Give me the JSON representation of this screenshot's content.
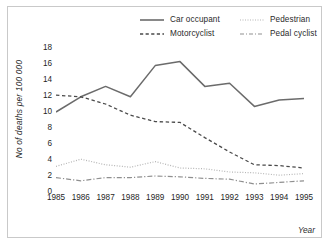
{
  "chart_data": {
    "type": "line",
    "title": "",
    "subtitle": "",
    "xlabel": "Year",
    "ylabel": "No of deaths per 100 000",
    "categories": [
      "1985",
      "1986",
      "1987",
      "1988",
      "1989",
      "1990",
      "1991",
      "1992",
      "1993",
      "1994",
      "1995"
    ],
    "x": [
      1985,
      1986,
      1987,
      1988,
      1989,
      1990,
      1991,
      1992,
      1993,
      1994,
      1995
    ],
    "xlim": [
      1985,
      1995
    ],
    "ylim": [
      0,
      18
    ],
    "yticks": [
      0,
      2,
      4,
      6,
      8,
      10,
      12,
      14,
      16,
      18
    ],
    "grid": false,
    "legend_position": "top-center",
    "series": [
      {
        "name": "Car occupant",
        "style": "solid",
        "color": "#6b6b6b",
        "values": [
          10.0,
          11.9,
          13.2,
          11.9,
          15.8,
          16.3,
          13.2,
          13.6,
          10.7,
          11.5,
          11.7
        ]
      },
      {
        "name": "Motorcyclist",
        "style": "dashed",
        "color": "#4a4a4a",
        "values": [
          12.1,
          11.9,
          11.0,
          9.6,
          8.8,
          8.7,
          6.8,
          5.0,
          3.4,
          3.3,
          3.0
        ]
      },
      {
        "name": "Pedestrian",
        "style": "dotted",
        "color": "#b5b5b5",
        "values": [
          3.2,
          4.1,
          3.4,
          3.1,
          3.8,
          3.0,
          2.9,
          2.5,
          2.4,
          2.1,
          2.3
        ]
      },
      {
        "name": "Pedal cyclist",
        "style": "dashdot",
        "color": "#8f8f8f",
        "values": [
          1.8,
          1.4,
          1.8,
          1.8,
          2.0,
          1.9,
          1.7,
          1.6,
          1.0,
          1.2,
          1.4
        ]
      }
    ]
  },
  "legend": {
    "entries": [
      {
        "label": "Car occupant"
      },
      {
        "label": "Motorcyclist"
      },
      {
        "label": "Pedestrian"
      },
      {
        "label": "Pedal cyclist"
      }
    ]
  },
  "axes": {
    "y_label": "No of deaths per 100 000",
    "x_label": "Year"
  }
}
